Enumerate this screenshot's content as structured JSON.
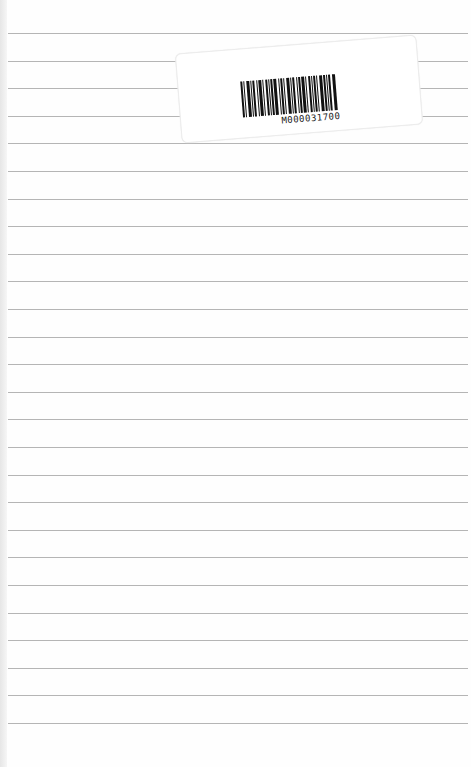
{
  "page": {
    "type": "lined notebook page",
    "rule_count": 26,
    "rule_first_y": 33,
    "rule_spacing": 27.6,
    "rule_color": "#b5b5b5",
    "background_color": "#fefefe"
  },
  "sticker": {
    "barcode_text": "M000031700",
    "faint_label": "",
    "barcode_pattern": [
      2,
      1,
      1,
      2,
      3,
      1,
      1,
      1,
      2,
      2,
      1,
      1,
      3,
      1,
      1,
      2,
      2,
      1,
      1,
      1,
      2,
      1,
      3,
      2,
      1,
      1,
      2,
      1,
      1,
      2,
      3,
      1,
      1,
      1,
      2,
      2,
      1,
      1,
      2,
      1,
      3,
      1,
      1,
      2,
      2,
      1,
      1,
      1,
      2,
      1,
      1,
      2,
      3,
      1,
      2,
      1,
      1,
      1,
      2,
      2,
      3,
      1
    ]
  }
}
